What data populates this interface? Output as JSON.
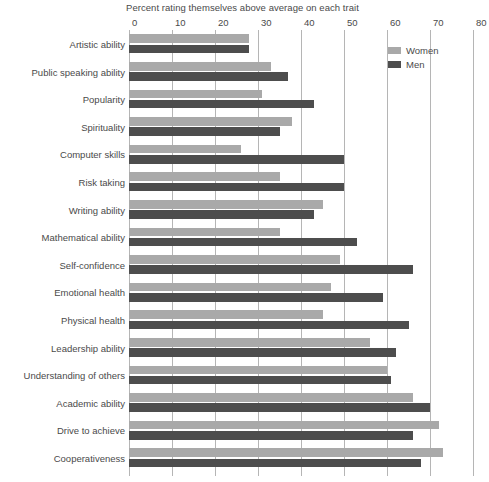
{
  "chart_data": {
    "type": "bar",
    "orientation": "horizontal",
    "grouped": true,
    "title": "Percent rating themselves above average on each trait",
    "xlabel": "",
    "ylabel": "",
    "xlim": [
      0,
      80
    ],
    "xticks": [
      0,
      10,
      20,
      30,
      40,
      50,
      60,
      70,
      80
    ],
    "xtick_labels": [
      "0",
      "10",
      "20",
      "30",
      "40",
      "50",
      "60",
      "70",
      "80"
    ],
    "grid": "vertical",
    "legend_position": "top-right",
    "categories": [
      "Artistic ability",
      "Public speaking ability",
      "Popularity",
      "Spirituality",
      "Computer skills",
      "Risk taking",
      "Writing ability",
      "Mathematical ability",
      "Self-confidence",
      "Emotional health",
      "Physical health",
      "Leadership ability",
      "Understanding of others",
      "Academic ability",
      "Drive to achieve",
      "Cooperativeness"
    ],
    "series": [
      {
        "name": "Women",
        "color": "#a9a9a9",
        "values": [
          28,
          33,
          31,
          38,
          26,
          35,
          45,
          35,
          49,
          47,
          45,
          56,
          60,
          66,
          72,
          73
        ]
      },
      {
        "name": "Men",
        "color": "#4d4d4d",
        "values": [
          28,
          37,
          43,
          35,
          50,
          50,
          43,
          53,
          66,
          59,
          65,
          62,
          61,
          70,
          66,
          68
        ]
      }
    ]
  },
  "legend": {
    "entries": [
      {
        "label": "Women",
        "swatch": "women"
      },
      {
        "label": "Men",
        "swatch": "men"
      }
    ]
  },
  "colors": {
    "women_bar": "#a9a9a9",
    "men_bar": "#4d4d4d",
    "gridline": "#b5b5b5",
    "text": "#4a4a4a",
    "background": "#ffffff"
  }
}
